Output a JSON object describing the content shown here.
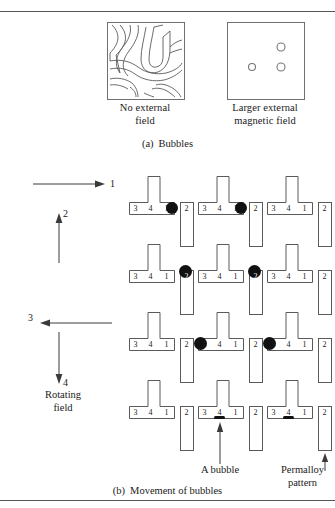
{
  "figure": {
    "part_a": {
      "label": "(a)",
      "title": "Bubbles",
      "panels": [
        {
          "name": "no-external-field",
          "caption_line1": "No external",
          "caption_line2": "field",
          "kind": "serpentine-domains"
        },
        {
          "name": "larger-external-magnetic-field",
          "caption_line1": "Larger external",
          "caption_line2": "magnetic field",
          "kind": "circular-bubbles",
          "bubbles": [
            {
              "cx": 53,
              "cy": 24,
              "r": 4
            },
            {
              "cx": 24,
              "cy": 44,
              "r": 3.5
            },
            {
              "cx": 53,
              "cy": 44,
              "r": 4
            }
          ]
        }
      ]
    },
    "part_b": {
      "label": "(b)",
      "title": "Movement of bubbles",
      "rotating_field": {
        "caption_line1": "Rotating",
        "caption_line2": "field",
        "steps": [
          {
            "number": "1",
            "direction": "right"
          },
          {
            "number": "2",
            "direction": "up"
          },
          {
            "number": "3",
            "direction": "left"
          },
          {
            "number": "4",
            "direction": "down"
          }
        ]
      },
      "segment_labels": {
        "t_bar": [
          "3",
          "4",
          "1"
        ],
        "i_bar": "2"
      },
      "annotations": [
        {
          "name": "a-bubble",
          "text": "A bubble"
        },
        {
          "name": "permalloy-pattern",
          "text_line1": "Permalloy",
          "text_line2": "pattern"
        }
      ],
      "rows": [
        {
          "step": "1",
          "bubble_sites": [
            "t1-right",
            "t2-right"
          ]
        },
        {
          "step": "2",
          "bubble_sites": [
            "i1-top",
            "i2-top"
          ]
        },
        {
          "step": "3",
          "bubble_sites": [
            "t2-left",
            "t3-left"
          ]
        },
        {
          "step": "4",
          "bubble_sites": [
            "t2-center-flat"
          ]
        }
      ]
    }
  },
  "colors": {
    "ink": "#1a1a1a",
    "outline": "#707070",
    "bubble": "#111111",
    "rule": "#555555"
  }
}
